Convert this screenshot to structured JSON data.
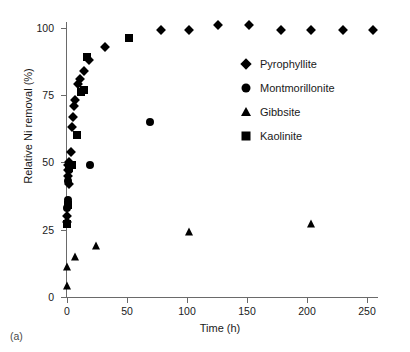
{
  "panel": {
    "label": "(a)"
  },
  "chart_data": {
    "type": "scatter",
    "title": "",
    "xlabel": "Time (h)",
    "ylabel": "Relative Ni removal (%)",
    "xlim": [
      0,
      255
    ],
    "ylim": [
      0,
      101
    ],
    "xticks": [
      0,
      50,
      100,
      150,
      200,
      250
    ],
    "yticks": [
      0,
      25,
      50,
      75,
      100
    ],
    "xtick_labels": [
      "0",
      "50",
      "100",
      "150",
      "200",
      "250"
    ],
    "ytick_labels": [
      "0",
      "25",
      "50",
      "75",
      "100"
    ],
    "grid": false,
    "legend_position": "center-right",
    "series": [
      {
        "name": "Pyrophyllite",
        "marker": "diamond",
        "color": "#000000",
        "points": [
          [
            0,
            28
          ],
          [
            0,
            30
          ],
          [
            1,
            45
          ],
          [
            1,
            47
          ],
          [
            1,
            49
          ],
          [
            2,
            42
          ],
          [
            2,
            50
          ],
          [
            3,
            54
          ],
          [
            4,
            63
          ],
          [
            5,
            67
          ],
          [
            6,
            71
          ],
          [
            7,
            73
          ],
          [
            9,
            79
          ],
          [
            11,
            81
          ],
          [
            14,
            84
          ],
          [
            18,
            88
          ],
          [
            32,
            93
          ],
          [
            78,
            99
          ],
          [
            102,
            99
          ],
          [
            126,
            101
          ],
          [
            152,
            101
          ],
          [
            178,
            99
          ],
          [
            203,
            99
          ],
          [
            230,
            99
          ],
          [
            255,
            99
          ]
        ]
      },
      {
        "name": "Montmorillonite",
        "marker": "circle",
        "color": "#000000",
        "points": [
          [
            0,
            27
          ],
          [
            0,
            33
          ],
          [
            1,
            36
          ],
          [
            1,
            43
          ],
          [
            2,
            47
          ],
          [
            3,
            49
          ],
          [
            19,
            49
          ],
          [
            69,
            65
          ]
        ]
      },
      {
        "name": "Gibbsite",
        "marker": "triangle",
        "color": "#000000",
        "points": [
          [
            0,
            4
          ],
          [
            0,
            11
          ],
          [
            7,
            15
          ],
          [
            24,
            19
          ],
          [
            102,
            24
          ],
          [
            203,
            27
          ]
        ]
      },
      {
        "name": "Kaolinite",
        "marker": "square",
        "color": "#000000",
        "points": [
          [
            0,
            27
          ],
          [
            1,
            34
          ],
          [
            2,
            48
          ],
          [
            4,
            49
          ],
          [
            8,
            60
          ],
          [
            12,
            76
          ],
          [
            14,
            77
          ],
          [
            17,
            89
          ],
          [
            52,
            96
          ]
        ]
      }
    ]
  },
  "legend": {
    "items": [
      {
        "label": "Pyrophyllite",
        "marker": "diamond"
      },
      {
        "label": "Montmorillonite",
        "marker": "circle"
      },
      {
        "label": "Gibbsite",
        "marker": "triangle"
      },
      {
        "label": "Kaolinite",
        "marker": "square"
      }
    ]
  }
}
